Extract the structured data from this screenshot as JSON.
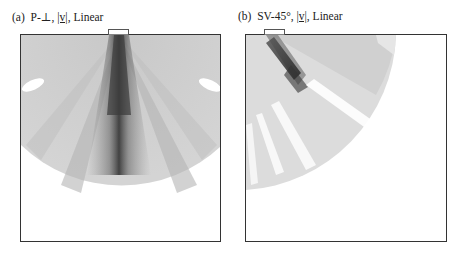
{
  "figure": {
    "panels": [
      {
        "id": "a",
        "label": "(a)",
        "wave_mode": "P-⊥,",
        "quantity": "|v|",
        "scale": ", Linear",
        "field": {
          "shape": "fan",
          "beam_angle_deg": 0,
          "beam_color": "#3a3a3a",
          "field_color": "#d8d8d8"
        }
      },
      {
        "id": "b",
        "label": "(b)",
        "wave_mode": "SV-45°,",
        "quantity": "|v|",
        "scale": ", Linear",
        "field": {
          "shape": "quarter-disc",
          "beam_angle_deg": 45,
          "beam_color": "#3a3a3a",
          "field_color": "#dcdcdc"
        }
      }
    ]
  }
}
